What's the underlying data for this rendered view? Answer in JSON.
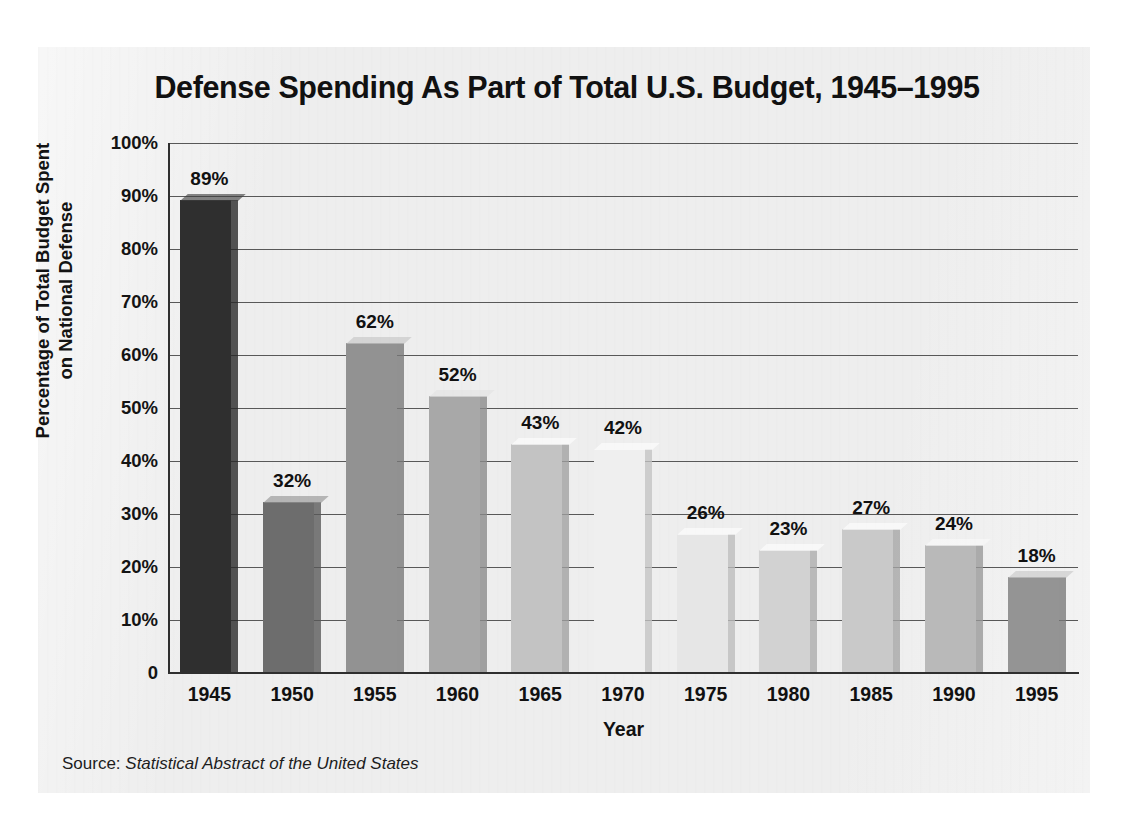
{
  "chart_data": {
    "type": "bar",
    "title": "Defense Spending As Part of Total U.S. Budget, 1945–1995",
    "xlabel": "Year",
    "ylabel_line1": "Percentage of Total Budget Spent",
    "ylabel_line2": "on National Defense",
    "categories": [
      "1945",
      "1950",
      "1955",
      "1960",
      "1965",
      "1970",
      "1975",
      "1980",
      "1985",
      "1990",
      "1995"
    ],
    "values": [
      89,
      32,
      62,
      52,
      43,
      42,
      26,
      23,
      27,
      24,
      18
    ],
    "value_labels": [
      "89%",
      "32%",
      "62%",
      "52%",
      "43%",
      "42%",
      "26%",
      "23%",
      "27%",
      "24%",
      "18%"
    ],
    "bar_colors": [
      "#2f2f2f",
      "#6d6d6d",
      "#929292",
      "#a8a8a8",
      "#c3c3c3",
      "#efefef",
      "#e6e6e6",
      "#d2d2d2",
      "#c9c9c9",
      "#b9b9b9",
      "#949494"
    ],
    "ylim": [
      0,
      100
    ],
    "ytick_values": [
      100,
      90,
      80,
      70,
      60,
      50,
      40,
      30,
      20,
      10,
      0
    ],
    "ytick_labels": [
      "100%",
      "90%",
      "80%",
      "70%",
      "60%",
      "50%",
      "40%",
      "30%",
      "20%",
      "10%",
      "0"
    ],
    "grid": true,
    "legend": "none",
    "axis_color": "#2f2f2f",
    "grid_color": "#585858",
    "background_color": "#eeeeee"
  },
  "source": {
    "prefix": "Source: ",
    "title": "Statistical Abstract of the United States"
  }
}
